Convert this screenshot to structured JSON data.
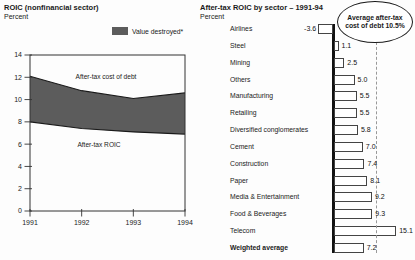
{
  "chart_data": [
    {
      "type": "area",
      "title": "ROIC (nonfinancial sector)",
      "subtitle": "Percent",
      "legend_label": "Value destroyed*",
      "band_color": "#5c5c5c",
      "x": [
        1991,
        1992,
        1993,
        1994
      ],
      "series": [
        {
          "name": "After-tax cost of debt",
          "values": [
            12.1,
            10.8,
            10.1,
            10.6
          ]
        },
        {
          "name": "After-tax ROIC",
          "values": [
            8.0,
            7.4,
            7.1,
            6.9
          ]
        }
      ],
      "ylim": [
        0,
        14
      ],
      "yticks": [
        0,
        2,
        4,
        6,
        8,
        10,
        12,
        14
      ],
      "xticks": [
        1991,
        1992,
        1993,
        1994
      ],
      "grid": false,
      "legend_position": "top-right"
    },
    {
      "type": "bar",
      "orientation": "horizontal",
      "title": "After-tax ROIC by sector – 1991-94",
      "subtitle": "Percent",
      "categories": [
        "Airlines",
        "Steel",
        "Mining",
        "Others",
        "Manufacturing",
        "Retailing",
        "Diversified conglomerates",
        "Cement",
        "Construction",
        "Paper",
        "Media & Entertainment",
        "Food & Beverages",
        "Telecom",
        "Weighted average"
      ],
      "values": [
        -3.6,
        1.1,
        2.5,
        5.0,
        5.5,
        5.5,
        5.8,
        7.0,
        7.4,
        8.1,
        9.2,
        9.3,
        15.1,
        7.2
      ],
      "value_labels": [
        "-3.6",
        "1.1",
        "2.5",
        "5.0",
        "5.5",
        "5.5",
        "5.8",
        "7.0",
        "7.4",
        "8.1",
        "9.2",
        "9.3",
        "15.1",
        "7.2"
      ],
      "callout": "Average after-tax cost of debt 10.5%",
      "reference_line": 10.5,
      "bar_fill": "#ffffff",
      "bar_border": "#444444"
    }
  ]
}
